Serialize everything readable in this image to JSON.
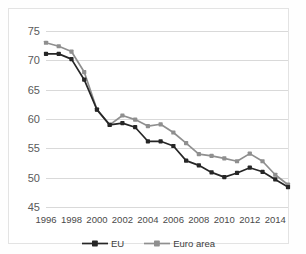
{
  "title_fragment": "",
  "legend": {
    "position": "bottom-center",
    "items": [
      {
        "label": "EU",
        "color": "#262626",
        "marker": "square"
      },
      {
        "label": "Euro area",
        "color": "#8f8f8f",
        "marker": "square"
      }
    ]
  },
  "chart_data": {
    "type": "line",
    "title": "",
    "subtitle": "",
    "xlabel": "",
    "ylabel": "",
    "ylim": [
      45,
      75
    ],
    "ystep": 5,
    "yticks": [
      45,
      50,
      55,
      60,
      65,
      70,
      75
    ],
    "xlim": [
      1996,
      2015
    ],
    "xticks": [
      1996,
      1998,
      2000,
      2002,
      2004,
      2006,
      2008,
      2010,
      2012,
      2014
    ],
    "x": [
      1996,
      1997,
      1998,
      1999,
      2000,
      2001,
      2002,
      2003,
      2004,
      2005,
      2006,
      2007,
      2008,
      2009,
      2010,
      2011,
      2012,
      2013,
      2014,
      2015
    ],
    "grid": "horizontal-only",
    "markers": true,
    "series": [
      {
        "name": "EU",
        "color": "#262626",
        "values": [
          71.1,
          71.1,
          70.2,
          66.7,
          61.6,
          59.0,
          59.3,
          58.6,
          56.2,
          56.2,
          55.4,
          52.9,
          52.1,
          50.9,
          50.1,
          50.8,
          51.7,
          51.0,
          49.7,
          48.4
        ]
      },
      {
        "name": "Euro area",
        "color": "#8f8f8f",
        "values": [
          73.0,
          72.4,
          71.5,
          68.0,
          61.6,
          59.0,
          60.6,
          59.9,
          58.8,
          59.1,
          57.7,
          55.9,
          54.0,
          53.7,
          53.3,
          52.8,
          54.1,
          52.8,
          50.5,
          48.8
        ]
      }
    ]
  }
}
